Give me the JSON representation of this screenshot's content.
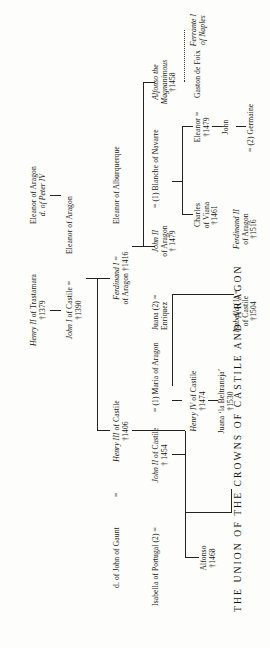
{
  "document": {
    "title": "THE UNION OF THE CROWNS OF CASTILE AND ARAGON",
    "orientation": "rotated-90-ccw",
    "ink_color": "#25241c",
    "paper_color": "#fdfdfb"
  },
  "people": {
    "henry_ii": {
      "name": "Henry II",
      "qualifier": "of Trastamara",
      "death": "†1379"
    },
    "eleanor_aragon": {
      "line1": "Eleanor of Aragon",
      "line2": "d. of Peter IV"
    },
    "john_i": {
      "name": "John I",
      "qualifier": "of Castile",
      "death": "†1390"
    },
    "john_i_spouse": {
      "name": "Eleanor of Aragon"
    },
    "catherine_lancaster": {
      "line1": "Catherine of Lancaster",
      "line2": "d. of John of Gaunt"
    },
    "henry_iii": {
      "name": "Henry III",
      "qualifier": "of Castile",
      "death": "†1406"
    },
    "ferdinand_i": {
      "name": "Ferdinand I",
      "qualifier": "of Aragon",
      "death": "†1416"
    },
    "eleanor_alburquerque": {
      "name": "Eleanor of Alburquerque"
    },
    "isabella_portugal": {
      "name": "Isabella of Portugal",
      "order": "(2)"
    },
    "john_ii_castile": {
      "name": "John II",
      "qualifier": "of Castile",
      "death": "† 1454"
    },
    "maria_aragon": {
      "order": "(1)",
      "name": "Maria of Aragon"
    },
    "juana_enriquez": {
      "order": "(2)",
      "line1": "Juana",
      "line2": "Enriquez"
    },
    "john_ii_aragon": {
      "name": "John II",
      "qualifier": "of Aragon",
      "death": "† 1479"
    },
    "blanche_navarre": {
      "order": "(1)",
      "name": "Blanche of Navarre"
    },
    "alfonso_magnanimous": {
      "line1": "Alfonso the",
      "line2": "Magnanimous",
      "death": "†1458"
    },
    "ferrante_naples": {
      "line1": "Ferrante I",
      "line2": "of Naples"
    },
    "charles_viana": {
      "line1": "Charles",
      "line2": "of Viana",
      "death": "†1461"
    },
    "eleanor_foix": {
      "name": "Eleanor",
      "death": "†1479"
    },
    "gaston_de_foix": {
      "name": "Gaston de Foix"
    },
    "john_foix": {
      "name": "John"
    },
    "germaine": {
      "order": "(2)",
      "name": "Germaine"
    },
    "henry_iv": {
      "name": "Henry IV",
      "qualifier": "of Castile",
      "death": "†1474"
    },
    "juana_beltraneja": {
      "name": "Juana ‘la Beltraneja’",
      "death": "†1530"
    },
    "alfonso": {
      "name": "Alfonso",
      "death": "†1468"
    },
    "isabella_i": {
      "name": "Isabella",
      "order": "(1)",
      "qualifier": "of Castile",
      "death": "†1504"
    },
    "ferdinand_ii": {
      "name": "Ferdinand II",
      "qualifier": "of Aragon",
      "death": "†1516"
    }
  },
  "symbols": {
    "marriage": "=",
    "dagger": "†"
  }
}
